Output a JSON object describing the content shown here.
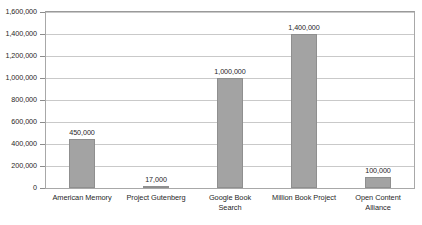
{
  "chart_data": {
    "type": "bar",
    "title": "",
    "subtitle": "",
    "xlabel": "",
    "ylabel": "",
    "categories": [
      "American Memory",
      "Project Gutenberg",
      "Google Book Search",
      "Million Book Project",
      "Open Content Alliance"
    ],
    "category_lines": [
      [
        "American Memory"
      ],
      [
        "Project Gutenberg"
      ],
      [
        "Google Book",
        "Search"
      ],
      [
        "Million Book Project"
      ],
      [
        "Open Content",
        "Alliance"
      ]
    ],
    "values": [
      450000,
      17000,
      1000000,
      1400000,
      100000
    ],
    "value_labels": [
      "450,000",
      "17,000",
      "1,000,000",
      "1,400,000",
      "100,000"
    ],
    "ylim": [
      0,
      1600000
    ],
    "ytick_values": [
      0,
      200000,
      400000,
      600000,
      800000,
      1000000,
      1200000,
      1400000,
      1600000
    ],
    "ytick_labels": [
      "0",
      "200,000",
      "400,000",
      "600,000",
      "800,000",
      "1,000,000",
      "1,200,000",
      "1,400,000",
      "1,600,000"
    ],
    "grid": true,
    "grid_axis": "y",
    "legend": false,
    "legend_position": "none",
    "bar_color": "#a3a3a3",
    "bar_edge_color": "#8f8f8f",
    "gridline_color": "#c9c9c9",
    "axis_color": "#a8a8a8",
    "text_color": "#1f1f1f",
    "background_color": "#ffffff"
  }
}
